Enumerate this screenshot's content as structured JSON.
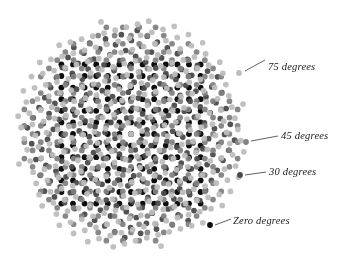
{
  "figure": {
    "width": 352,
    "height": 268,
    "background_color": "#ffffff"
  },
  "chart_data": {
    "type": "scatter",
    "title": "",
    "xlabel": "",
    "ylabel": "",
    "grid": false,
    "legend_position": "right-callouts",
    "center": {
      "x": 131,
      "y": 134
    },
    "lattice_pitch": 11.6,
    "dot_radius": 2.9,
    "xlim": [
      0,
      352
    ],
    "ylim": [
      0,
      268
    ],
    "series": [
      {
        "name": "Zero degrees",
        "angle_degrees": 0,
        "color": "#0d0d0d",
        "shape": "square-lattice",
        "extent": "square",
        "half_span": 80,
        "dot_radius": 2.9,
        "opacity": 1.0
      },
      {
        "name": "30 degrees",
        "angle_degrees": 30,
        "color": "#4a4a4a",
        "shape": "square-lattice",
        "extent": "disc",
        "half_span": 104,
        "dot_radius": 2.85,
        "opacity": 0.95
      },
      {
        "name": "45 degrees",
        "angle_degrees": 45,
        "color": "#828282",
        "shape": "square-lattice",
        "extent": "disc",
        "half_span": 110,
        "dot_radius": 2.85,
        "opacity": 0.95
      },
      {
        "name": "75 degrees",
        "angle_degrees": 75,
        "color": "#bdbdbd",
        "shape": "square-lattice",
        "extent": "disc",
        "half_span": 116,
        "dot_radius": 2.85,
        "opacity": 0.95
      }
    ],
    "annotations": [
      {
        "id": "callout-75",
        "text": "75 degrees",
        "series": "75 degrees",
        "swatch_color": "#bdbdbd",
        "marker": {
          "x": 239,
          "y": 73
        },
        "leader_from": {
          "x": 245,
          "y": 71
        },
        "leader_to": {
          "x": 265,
          "y": 60
        },
        "label_position": {
          "x": 268,
          "y": 61
        }
      },
      {
        "id": "callout-45",
        "text": "45 degrees",
        "series": "45 degrees",
        "swatch_color": "#828282",
        "marker": {
          "x": 246,
          "y": 142
        },
        "leader_from": {
          "x": 251,
          "y": 141
        },
        "leader_to": {
          "x": 278,
          "y": 136
        },
        "label_position": {
          "x": 281,
          "y": 130
        }
      },
      {
        "id": "callout-30",
        "text": "30 degrees",
        "series": "30 degrees",
        "swatch_color": "#4a4a4a",
        "marker": {
          "x": 240,
          "y": 175
        },
        "leader_from": {
          "x": 245,
          "y": 175
        },
        "leader_to": {
          "x": 266,
          "y": 172
        },
        "label_position": {
          "x": 269,
          "y": 166
        }
      },
      {
        "id": "callout-zero",
        "text": "Zero degrees",
        "series": "Zero degrees",
        "swatch_color": "#0d0d0d",
        "marker": {
          "x": 210,
          "y": 225
        },
        "leader_from": {
          "x": 215,
          "y": 225
        },
        "leader_to": {
          "x": 231,
          "y": 219
        },
        "label_position": {
          "x": 233,
          "y": 215
        }
      }
    ]
  },
  "callouts": {
    "deg75": "75 degrees",
    "deg45": "45 degrees",
    "deg30": "30 degrees",
    "deg0": "Zero degrees"
  },
  "colors": {
    "zero_degrees": "#0d0d0d",
    "thirty_degrees": "#4a4a4a",
    "fortyfive_degrees": "#828282",
    "seventyfive_degrees": "#bdbdbd",
    "leader_line": "#3a3a3a",
    "label_text": "#1a1a1a"
  }
}
